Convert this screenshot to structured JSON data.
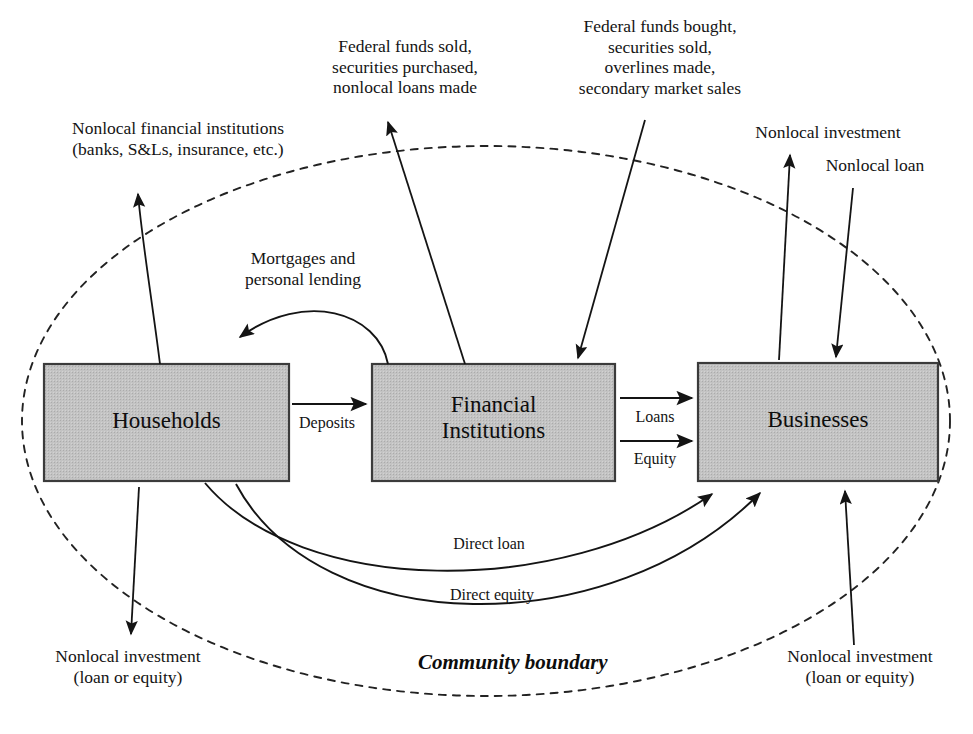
{
  "figure": {
    "type": "flow-diagram",
    "background_color": "#ffffff",
    "line_color": "#1a1a1a",
    "node_fill_color": "#c0c0c0",
    "node_stroke_color": "#3a3a3a",
    "boundary_style": "dashed-ellipse"
  },
  "nodes": [
    {
      "id": "households",
      "label": "Households",
      "x": 44,
      "y": 364,
      "w": 245,
      "h": 117
    },
    {
      "id": "financial_institutions",
      "label": "Financial\nInstitutions",
      "x": 372,
      "y": 364,
      "w": 243,
      "h": 117
    },
    {
      "id": "businesses",
      "label": "Businesses",
      "x": 698,
      "y": 363,
      "w": 240,
      "h": 118
    }
  ],
  "boundary": {
    "label": "Community boundary",
    "label_x": 418,
    "label_y": 650
  },
  "edge_labels": [
    {
      "id": "deposits",
      "text": "Deposits",
      "x": 293,
      "y": 418
    },
    {
      "id": "loans",
      "text": "Loans",
      "x": 628,
      "y": 412
    },
    {
      "id": "equity",
      "text": "Equity",
      "x": 626,
      "y": 453
    },
    {
      "id": "direct-loan",
      "text": "Direct loan",
      "x": 439,
      "y": 539
    },
    {
      "id": "direct-equity",
      "text": "Direct equity",
      "x": 432,
      "y": 589
    }
  ],
  "annotations": [
    {
      "id": "nonlocal-financial-institutions",
      "text": "Nonlocal financial institutions\n(banks, S&Ls, insurance, etc.)",
      "x": 28,
      "y": 118,
      "width": 300,
      "align": "center"
    },
    {
      "id": "federal-funds-sold",
      "text": "Federal funds sold,\nsecurities purchased,\nnonlocal loans made",
      "x": 300,
      "y": 36,
      "width": 210,
      "align": "center"
    },
    {
      "id": "federal-funds-bought",
      "text": "Federal funds bought,\nsecurities sold,\noverlines made,\nsecondary market sales",
      "x": 540,
      "y": 16,
      "width": 240,
      "align": "center"
    },
    {
      "id": "nonlocal-investment-top",
      "text": "Nonlocal investment",
      "x": 723,
      "y": 122,
      "width": 210,
      "align": "center"
    },
    {
      "id": "nonlocal-loan-top",
      "text": "Nonlocal loan",
      "x": 790,
      "y": 155,
      "width": 170,
      "align": "center"
    },
    {
      "id": "mortgages-and-personal-lending",
      "text": "Mortgages and\npersonal lending",
      "x": 208,
      "y": 248,
      "width": 190,
      "align": "center"
    },
    {
      "id": "nonlocal-investment-bottom-left",
      "text": "Nonlocal investment\n(loan or equity)",
      "x": 18,
      "y": 646,
      "width": 220,
      "align": "center"
    },
    {
      "id": "nonlocal-investment-bottom-right",
      "text": "Nonlocal investment\n(loan or equity)",
      "x": 750,
      "y": 646,
      "width": 220,
      "align": "center"
    }
  ],
  "flows": [
    {
      "id": "households-to-financial",
      "from": "Households",
      "to": "Financial Institutions",
      "label": "Deposits"
    },
    {
      "id": "financial-to-businesses-loans",
      "from": "Financial Institutions",
      "to": "Businesses",
      "label": "Loans"
    },
    {
      "id": "financial-to-businesses-equity",
      "from": "Financial Institutions",
      "to": "Businesses",
      "label": "Equity"
    },
    {
      "id": "financial-to-households",
      "from": "Financial Institutions",
      "to": "Households",
      "label": "Mortgages and personal lending"
    },
    {
      "id": "households-to-businesses-loan",
      "from": "Households",
      "to": "Businesses",
      "label": "Direct loan"
    },
    {
      "id": "households-to-businesses-equity",
      "from": "Households",
      "to": "Businesses",
      "label": "Direct equity"
    },
    {
      "id": "households-outflow",
      "from": "Households",
      "to": "Outside",
      "label": "Nonlocal financial institutions (banks, S&Ls, insurance, etc.)"
    },
    {
      "id": "households-inflow-bottom",
      "from": "Outside",
      "to": "Households",
      "label": "Nonlocal investment (loan or equity)"
    },
    {
      "id": "financial-outflow",
      "from": "Financial Institutions",
      "to": "Outside",
      "label": "Federal funds sold, securities purchased, nonlocal loans made"
    },
    {
      "id": "financial-inflow",
      "from": "Outside",
      "to": "Financial Institutions",
      "label": "Federal funds bought, securities sold, overlines made, secondary market sales"
    },
    {
      "id": "businesses-outflow",
      "from": "Businesses",
      "to": "Outside",
      "label": "Nonlocal investment"
    },
    {
      "id": "businesses-inflow",
      "from": "Outside",
      "to": "Businesses",
      "label": "Nonlocal loan"
    },
    {
      "id": "businesses-inflow-bottom",
      "from": "Outside",
      "to": "Businesses",
      "label": "Nonlocal investment (loan or equity)"
    }
  ]
}
